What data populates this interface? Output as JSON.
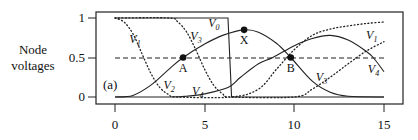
{
  "chart_data": {
    "type": "line",
    "title": "",
    "panel_label": "(a)",
    "xlabel": "",
    "ylabel": "Node voltages",
    "xlim": [
      0,
      15
    ],
    "ylim": [
      0,
      1
    ],
    "xticks": [
      "0",
      "5",
      "10",
      "15"
    ],
    "yticks": [
      "0",
      "0.5",
      "1"
    ],
    "grid": false,
    "legend": "inline labels",
    "reference_lines": [
      {
        "name": "threshold",
        "y": 0.5,
        "style": "dashed",
        "x_range": [
          0,
          15
        ]
      }
    ],
    "series": [
      {
        "name": "V0",
        "style": "solid",
        "x": [
          0,
          6.3,
          6.5,
          15
        ],
        "y": [
          1,
          1,
          0,
          0
        ]
      },
      {
        "name": "V1",
        "style": "dotted",
        "x": [
          0,
          0.5,
          1,
          1.5,
          2,
          2.5,
          3,
          3.5,
          6.5,
          8,
          9,
          10,
          11,
          12,
          13,
          14,
          15
        ],
        "y": [
          1,
          0.95,
          0.8,
          0.55,
          0.3,
          0.12,
          0.03,
          0.0,
          0.0,
          0.1,
          0.35,
          0.6,
          0.78,
          0.86,
          0.9,
          0.93,
          0.95
        ]
      },
      {
        "name": "V2",
        "style": "solid",
        "x": [
          0,
          1,
          2,
          3,
          3.8,
          5,
          6,
          7.2,
          8,
          9,
          9.8,
          11,
          12,
          13,
          15
        ],
        "y": [
          0,
          0.02,
          0.15,
          0.35,
          0.5,
          0.67,
          0.78,
          0.85,
          0.82,
          0.68,
          0.5,
          0.2,
          0.06,
          0.01,
          0
        ]
      },
      {
        "name": "V3",
        "style": "dotted",
        "x": [
          0,
          3,
          3.5,
          4,
          4.5,
          5,
          5.5,
          6,
          6.5,
          10,
          11,
          12,
          13,
          14,
          15
        ],
        "y": [
          1,
          1,
          0.95,
          0.82,
          0.6,
          0.35,
          0.15,
          0.04,
          0.0,
          0.0,
          0.1,
          0.25,
          0.42,
          0.58,
          0.7
        ]
      },
      {
        "name": "V4",
        "style": "solid",
        "x": [
          0,
          3,
          4,
          5,
          6.3,
          7,
          8,
          8.8,
          10,
          11,
          12,
          13,
          14,
          14.4,
          15
        ],
        "y": [
          0,
          0,
          0.01,
          0.04,
          0.12,
          0.25,
          0.42,
          0.5,
          0.65,
          0.74,
          0.78,
          0.72,
          0.58,
          0.5,
          0.32
        ]
      }
    ],
    "annotations": [
      {
        "label": "A",
        "x": 3.8,
        "y": 0.5,
        "marker": "filled-circle"
      },
      {
        "label": "X",
        "x": 7.2,
        "y": 0.85,
        "marker": "filled-circle"
      },
      {
        "label": "B",
        "x": 9.8,
        "y": 0.5,
        "marker": "filled-circle"
      }
    ],
    "series_labels": [
      {
        "name": "V0",
        "main": "V",
        "sub": "0",
        "x": 5.2,
        "y": 0.88
      },
      {
        "name": "V1",
        "main": "V",
        "sub": "1",
        "x": 0.8,
        "y": 0.68
      },
      {
        "name": "V3",
        "main": "V",
        "sub": "3",
        "x": 4.2,
        "y": 0.72
      },
      {
        "name": "V2",
        "main": "V",
        "sub": "2",
        "x": 2.7,
        "y": 0.1
      },
      {
        "name": "V4",
        "main": "V",
        "sub": "4",
        "x": 4.3,
        "y": 0.03
      },
      {
        "name": "V1",
        "main": "V",
        "sub": "1",
        "x": 14.0,
        "y": 0.74
      },
      {
        "name": "V3",
        "main": "V",
        "sub": "3",
        "x": 11.2,
        "y": 0.2
      },
      {
        "name": "V4",
        "main": "V",
        "sub": "4",
        "x": 14.1,
        "y": 0.3
      }
    ]
  },
  "labels": {
    "ylabel_line1": "Node",
    "ylabel_line2": "voltages",
    "panel": "(a)",
    "point_a": "A",
    "point_x": "X",
    "point_b": "B"
  }
}
